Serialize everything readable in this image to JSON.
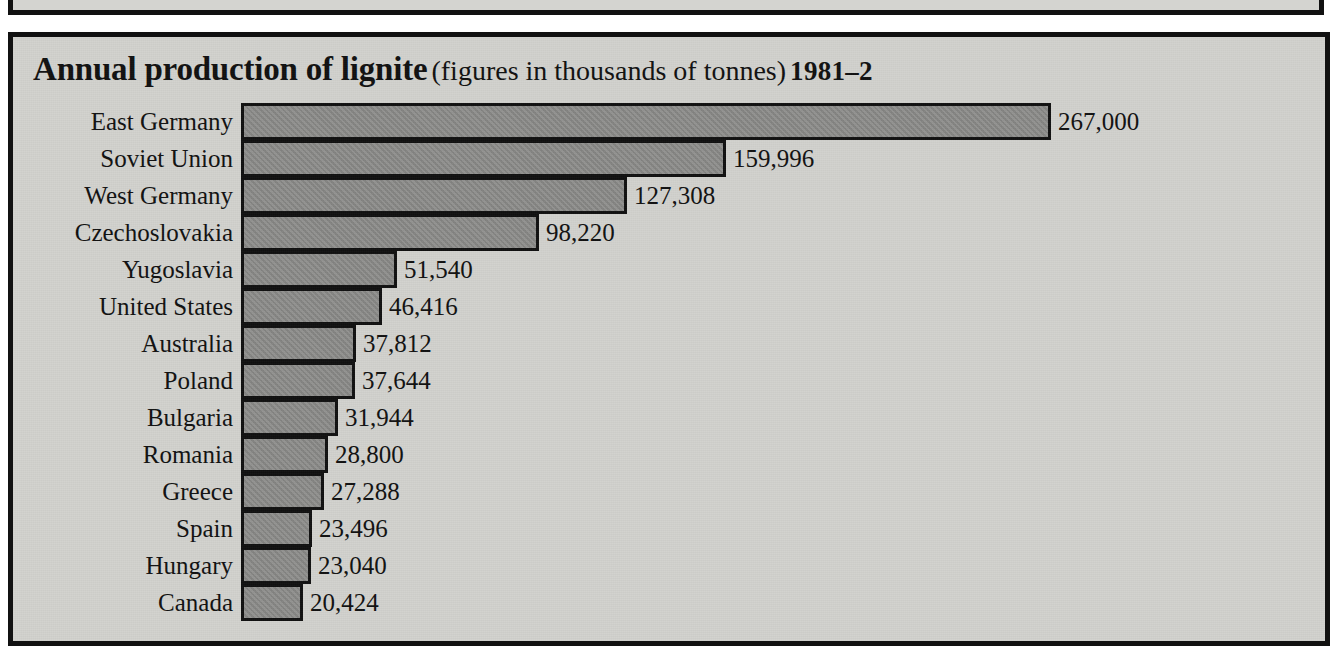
{
  "page": {
    "background_color": "#d2d2ce",
    "frame_color": "#111111",
    "bar_color": "#8b8b89"
  },
  "title": {
    "main": "Annual production of lignite",
    "parenthetical": "(figures in thousands of tonnes)",
    "years": "1981–2"
  },
  "chart_data": {
    "type": "bar",
    "orientation": "horizontal",
    "title": "Annual production of lignite (figures in thousands of tonnes) 1981–2",
    "xlabel": "",
    "ylabel": "",
    "grid": false,
    "legend": "none",
    "value_unit": "thousands of tonnes",
    "xlim": [
      0,
      267000
    ],
    "categories": [
      "East Germany",
      "Soviet Union",
      "West Germany",
      "Czechoslovakia",
      "Yugoslavia",
      "United States",
      "Australia",
      "Poland",
      "Bulgaria",
      "Romania",
      "Greece",
      "Spain",
      "Hungary",
      "Canada"
    ],
    "values": [
      267000,
      159996,
      127308,
      98220,
      51540,
      46416,
      37812,
      37644,
      31944,
      28800,
      27288,
      23496,
      23040,
      20424
    ],
    "value_labels": [
      "267,000",
      "159,996",
      "127,308",
      "98,220",
      "51,540",
      "46,416",
      "37,812",
      "37,644",
      "31,944",
      "28,800",
      "27,288",
      "23,496",
      "23,040",
      "20,424"
    ]
  }
}
